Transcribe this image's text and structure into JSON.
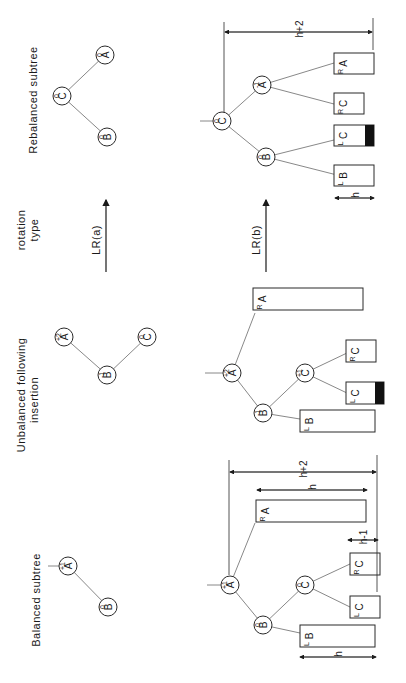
{
  "figure": {
    "columns": {
      "balanced": "Balanced    subtree",
      "unbalanced_line1": "Unbalanced    following",
      "unbalanced_line2": "insertion",
      "rotation_line1": "rotation",
      "rotation_line2": "type",
      "rebalanced": "Rebalanced    subtree"
    },
    "rotation_types": [
      "LR(a)",
      "LR(b)"
    ],
    "case_a": {
      "balanced": [
        {
          "id": "A",
          "balance": "+1"
        },
        {
          "id": "B",
          "balance": "0"
        }
      ],
      "unbalanced": [
        {
          "id": "A",
          "balance": "+2"
        },
        {
          "id": "B",
          "balance": "-1"
        },
        {
          "id": "C",
          "balance": "0"
        }
      ],
      "rebalanced": [
        {
          "id": "C",
          "balance": "0"
        },
        {
          "id": "B",
          "balance": "0"
        },
        {
          "id": "A",
          "balance": "0"
        }
      ]
    },
    "case_b": {
      "balanced": {
        "nodes": [
          {
            "id": "A",
            "balance": "+1"
          },
          {
            "id": "B",
            "balance": "0"
          },
          {
            "id": "C",
            "balance": "0"
          }
        ],
        "subtrees": [
          {
            "name": "B",
            "sub": "L"
          },
          {
            "name": "C",
            "sub": "L"
          },
          {
            "name": "C",
            "sub": "R"
          },
          {
            "name": "A",
            "sub": "R"
          }
        ],
        "dims": [
          "h",
          "h-1",
          "h",
          "h+2"
        ]
      },
      "unbalanced": {
        "nodes": [
          {
            "id": "A",
            "balance": "+2"
          },
          {
            "id": "B",
            "balance": "-1"
          },
          {
            "id": "C",
            "balance": "+1"
          }
        ],
        "subtrees": [
          {
            "name": "B",
            "sub": "L"
          },
          {
            "name": "C",
            "sub": "L"
          },
          {
            "name": "C",
            "sub": "R"
          },
          {
            "name": "A",
            "sub": "R"
          }
        ]
      },
      "rebalanced": {
        "nodes": [
          {
            "id": "C",
            "balance": "0"
          },
          {
            "id": "B",
            "balance": "0"
          },
          {
            "id": "A",
            "balance": "-1"
          }
        ],
        "subtrees": [
          {
            "name": "B",
            "sub": "L"
          },
          {
            "name": "C",
            "sub": "L"
          },
          {
            "name": "C",
            "sub": "R"
          },
          {
            "name": "A",
            "sub": "R"
          }
        ],
        "dims": [
          "h",
          "h+2"
        ]
      }
    }
  }
}
